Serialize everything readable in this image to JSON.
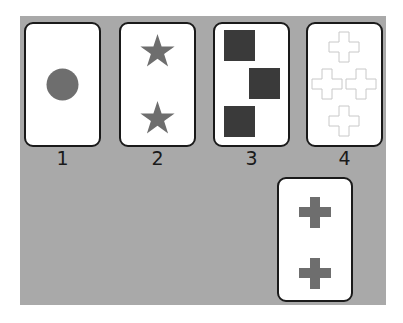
{
  "colors": {
    "table": "#a9a9a9",
    "card_face": "#ffffff",
    "card_border": "#1a1a1a",
    "gray_shape": "#6e6e6e",
    "dark_shape": "#3a3a3a",
    "outline_shape": "#c8c8c8"
  },
  "reference_cards": [
    {
      "label": "1",
      "shape": "circle",
      "count": 1,
      "fill": "gray"
    },
    {
      "label": "2",
      "shape": "star",
      "count": 2,
      "fill": "gray"
    },
    {
      "label": "3",
      "shape": "square",
      "count": 3,
      "fill": "dark"
    },
    {
      "label": "4",
      "shape": "cross",
      "count": 4,
      "fill": "outline"
    }
  ],
  "stimulus_card": {
    "shape": "cross",
    "count": 2,
    "fill": "gray"
  }
}
